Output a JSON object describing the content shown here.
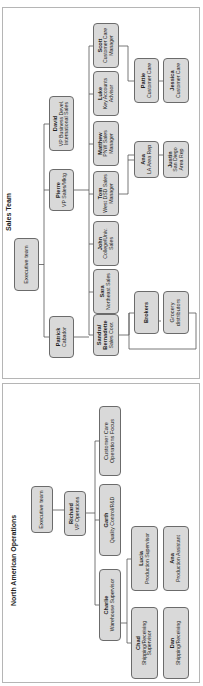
{
  "sales_team": {
    "title": "Sales Team",
    "executive": {
      "label": "Executive team"
    },
    "level1": [
      {
        "name": "Patrick",
        "role": "Cabador"
      },
      {
        "name": "Pierre",
        "role": "VP Sales/Mktg"
      },
      {
        "name": "David",
        "role": "VP Business Devel. International Sales"
      }
    ],
    "level2": [
      {
        "name": "Sandra/ Bernadette",
        "role": "Sales Coor."
      },
      {
        "name": "Sara",
        "role": "Northeast Sales"
      },
      {
        "name": "John",
        "role": "College/Univ. Sales"
      },
      {
        "name": "Tom",
        "role": "West DSD Sales Manager"
      },
      {
        "name": "Matthew",
        "role": "PNW Sales Manager"
      },
      {
        "name": "Luke",
        "role": "Key Accounts Advisor"
      },
      {
        "name": "Scott",
        "role": "Customer Care Manager"
      }
    ],
    "level3": [
      {
        "label": "Brokers"
      },
      {
        "label": "Grocery distributors"
      },
      {
        "name": "Ana",
        "role": "LA Area Rep"
      },
      {
        "name": "Justin",
        "role": "San Diego Area Rep"
      },
      {
        "name": "Pattie",
        "role": "Customer Care"
      },
      {
        "name": "Jessica",
        "role": "Customer Care"
      }
    ]
  },
  "north_american_operations": {
    "title": "North American Operations",
    "executive": {
      "label": "Executive team"
    },
    "vp": {
      "name": "Richard",
      "role": "VP Operations"
    },
    "level2": [
      {
        "name": "Charlie",
        "role": "Warehouse Supervisor"
      },
      {
        "name": "Garth",
        "role": "Quality Control/R&D"
      },
      {
        "label": "Customer Care Operations Focus"
      }
    ],
    "level3": [
      {
        "name": "Chad",
        "role": "Shipping/Receiving Supervisor"
      },
      {
        "name": "Dan",
        "role": "Shipping/Receiving"
      },
      {
        "name": "Lucia",
        "role": "Production Supervisor"
      },
      {
        "name": "Ana",
        "role": "Production Assistant"
      }
    ]
  },
  "colors": {
    "box_fill": "#d9d9d9",
    "box_border": "#6b6b6b",
    "line": "#555555",
    "panel_border": "#b5b5b5"
  }
}
